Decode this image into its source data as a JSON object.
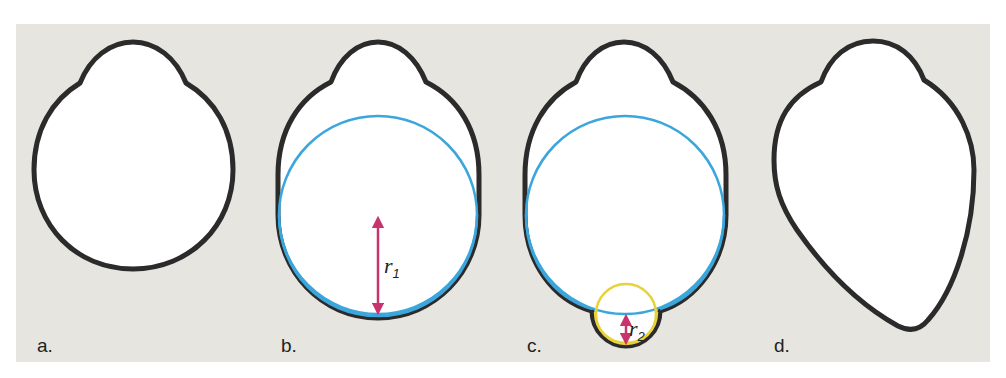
{
  "figure": {
    "panels": [
      {
        "id": "a",
        "label": "a."
      },
      {
        "id": "b",
        "label": "b.",
        "radius_label": "r",
        "radius_sub": "1"
      },
      {
        "id": "c",
        "label": "c.",
        "radius_label": "r",
        "radius_sub": "2"
      },
      {
        "id": "d",
        "label": "d."
      }
    ],
    "colors": {
      "background": "#e6e5e0",
      "outline": "#2b2b2b",
      "fill": "#ffffff",
      "large_circle": "#3aa6dc",
      "small_circle": "#e8d23a",
      "radius_arrow": "#c8336e"
    }
  }
}
